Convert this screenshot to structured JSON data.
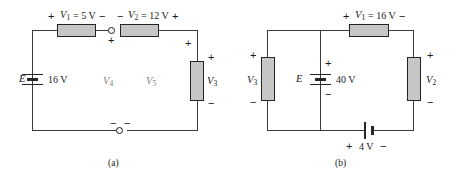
{
  "figure": {
    "type": "circuit-diagram"
  },
  "circuit_a": {
    "caption": "(a)",
    "source": {
      "symbol_label": "E",
      "value": "16 V"
    },
    "top_left_branch": {
      "plus": "+",
      "label": "V",
      "sub": "1",
      "equals_value": "= 5 V",
      "minus": "−"
    },
    "top_right_branch": {
      "minus": "−",
      "label": "V",
      "sub": "2",
      "equals_value": "= 12 V",
      "plus": "+"
    },
    "node_top": {
      "sign": "+"
    },
    "node_bottom": {
      "sign_left": "−",
      "sign_right": "−"
    },
    "right_branch": {
      "label": "V",
      "sub": "3",
      "plus": "+",
      "minus": "−",
      "corner_plus": "+"
    },
    "inner_labels": [
      {
        "label": "V",
        "sub": "4"
      },
      {
        "label": "V",
        "sub": "5"
      }
    ]
  },
  "circuit_b": {
    "caption": "(b)",
    "source": {
      "symbol_label": "E",
      "value": "40 V",
      "plus": "+",
      "minus": "−"
    },
    "top_branch": {
      "plus": "+",
      "label": "V",
      "sub": "1",
      "equals_value": "= 16 V",
      "minus": "−"
    },
    "left_branch": {
      "label": "V",
      "sub": "3",
      "plus": "+",
      "minus": "−"
    },
    "right_branch": {
      "label": "V",
      "sub": "2",
      "plus": "+",
      "minus": "−"
    },
    "bottom_source": {
      "plus": "+",
      "value": "4 V",
      "minus": "−"
    }
  },
  "colors": {
    "resistor_fill": "#c6c6c6",
    "wire": "#3b3b3b",
    "outline": "#242424",
    "text": "#1a1a1a",
    "faded_text": "#7d7d7d"
  }
}
